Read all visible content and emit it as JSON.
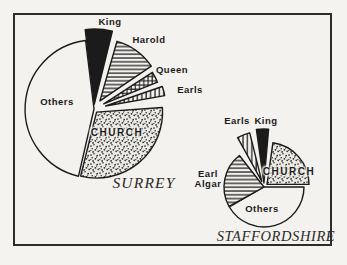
{
  "figure": {
    "caption_left": "SURREY",
    "caption_right": "STAFFORDSHIRE",
    "ink_color": "#1b1b1b",
    "paper_color": "#f4f2ee"
  },
  "chart_data": [
    {
      "type": "pie",
      "title": "SURREY",
      "categories": [
        "King",
        "Harold",
        "Queen",
        "Earls",
        "CHURCH",
        "Others"
      ],
      "values_pct_est": [
        6,
        11,
        3,
        2.5,
        30,
        47.5
      ],
      "values_deg": [
        21,
        40,
        11,
        9,
        108,
        160
      ],
      "legend_position": "labels-around-slices",
      "style": "exploded black-and-white engraving, patterns: solid, horizontal-hatch, cross-hatch, vertical-hatch, stipple, plain"
    },
    {
      "type": "pie",
      "title": "STAFFORDSHIRE",
      "categories": [
        "Earls",
        "King",
        "CHURCH",
        "Earl Algar",
        "Others"
      ],
      "values_pct_est": [
        4,
        4,
        23,
        22.5,
        46.5
      ],
      "values_deg": [
        15,
        13,
        82,
        81,
        150
      ],
      "legend_position": "labels-around-slices",
      "style": "exploded black-and-white engraving, patterns: vertical-hatch, solid, stipple, horizontal-hatch, plain"
    }
  ],
  "pies": [
    {
      "name": "surrey",
      "cx": 94,
      "cy": 109,
      "slices": [
        {
          "label": "Others",
          "pattern": "plain",
          "start": 193,
          "end": 353,
          "explode": 0,
          "r": 69
        },
        {
          "label": "King",
          "pattern": "solid",
          "start": 353,
          "end": 374,
          "explode": 5,
          "r": 75
        },
        {
          "label": "Harold",
          "pattern": "hatch-h",
          "start": 16,
          "end": 56,
          "explode": 10,
          "r": 62
        },
        {
          "label": "Queen",
          "pattern": "hatch-grid",
          "start": 57,
          "end": 68,
          "explode": 11,
          "r": 58
        },
        {
          "label": "Earls",
          "pattern": "hatch-v",
          "start": 71,
          "end": 80,
          "explode": 12,
          "r": 60
        },
        {
          "label": "CHURCH",
          "pattern": "stipple",
          "start": 86,
          "end": 194,
          "explode": 4,
          "r": 66
        }
      ],
      "labels": [
        {
          "name": "surrey-king-label",
          "text": "King",
          "x": 110,
          "y": 22,
          "cls": "sans"
        },
        {
          "name": "surrey-harold-label",
          "text": "Harold",
          "x": 149,
          "y": 40,
          "cls": "sans"
        },
        {
          "name": "surrey-queen-label",
          "text": "Queen",
          "x": 172,
          "y": 70,
          "cls": "sans"
        },
        {
          "name": "surrey-earls-label",
          "text": "Earls",
          "x": 190,
          "y": 90,
          "cls": "sans"
        },
        {
          "name": "surrey-others-label",
          "text": "Others",
          "x": 57,
          "y": 102,
          "cls": "sans"
        },
        {
          "name": "surrey-church-label",
          "text": "CHURCH",
          "x": 117,
          "y": 133,
          "cls": "sans-caps on-stipple"
        },
        {
          "name": "surrey-title",
          "text": "SURREY",
          "x": 144,
          "y": 183,
          "cls": "serif-title"
        }
      ]
    },
    {
      "name": "staffordshire",
      "cx": 264,
      "cy": 187,
      "slices": [
        {
          "label": "Others",
          "pattern": "plain",
          "start": 90,
          "end": 240,
          "explode": 0,
          "r": 40
        },
        {
          "label": "Earl Algar",
          "pattern": "hatch-h",
          "start": 241,
          "end": 322,
          "explode": 0,
          "r": 40
        },
        {
          "label": "Earls",
          "pattern": "hatch-v",
          "start": 331,
          "end": 346,
          "explode": 6,
          "r": 50
        },
        {
          "label": "King",
          "pattern": "solid",
          "start": 352,
          "end": 365,
          "explode": 4,
          "r": 54
        },
        {
          "label": "CHURCH",
          "pattern": "stipple",
          "start": 8,
          "end": 90,
          "explode": 4,
          "r": 42
        }
      ],
      "labels": [
        {
          "name": "staffordshire-earls-label",
          "text": "Earls",
          "x": 237,
          "y": 121,
          "cls": "sans"
        },
        {
          "name": "staffordshire-king-label",
          "text": "King",
          "x": 266,
          "y": 121,
          "cls": "sans"
        },
        {
          "name": "staffordshire-earl-algar-label",
          "text": "Earl\nAlgar",
          "x": 208,
          "y": 179,
          "cls": "sans"
        },
        {
          "name": "staffordshire-church-label",
          "text": "CHURCH",
          "x": 289,
          "y": 172,
          "cls": "sans-caps on-stipple"
        },
        {
          "name": "staffordshire-others-label",
          "text": "Others",
          "x": 262,
          "y": 209,
          "cls": "sans"
        },
        {
          "name": "staffordshire-title",
          "text": "STAFFORDSHIRE",
          "x": 276,
          "y": 237,
          "cls": "serif-title long"
        }
      ]
    }
  ]
}
